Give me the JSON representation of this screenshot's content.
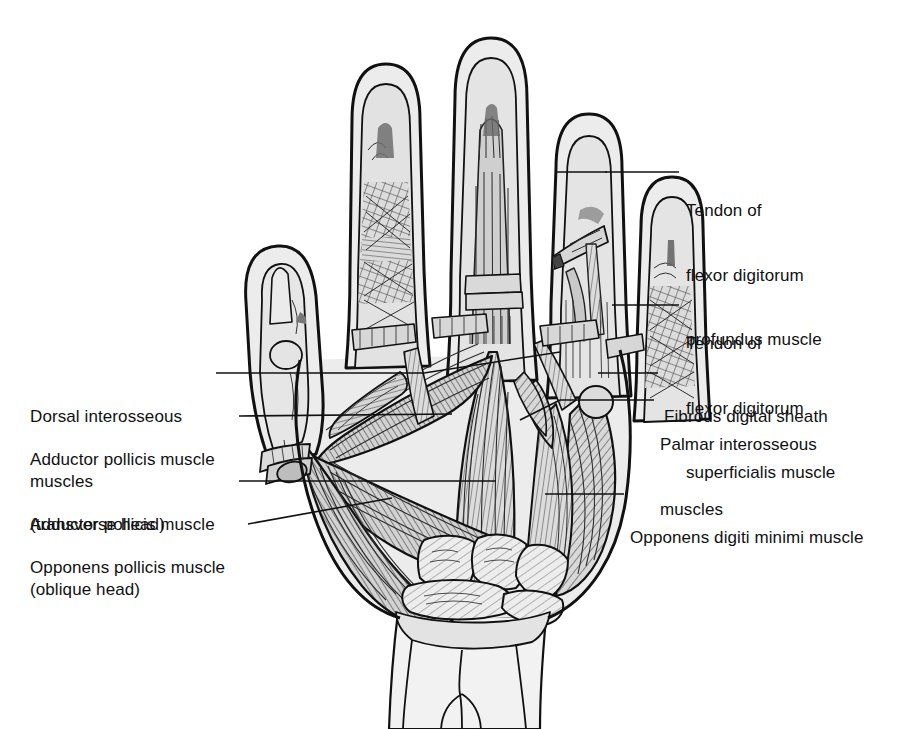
{
  "figure": {
    "background_color": "#ffffff",
    "ink_color": "#111111",
    "skin_fill": "#e9e9e9",
    "muscle_fill": "#d4d4d4",
    "shadow_fill": "#9a9a9a"
  },
  "labels": {
    "right": [
      {
        "id": "tendon-flexor-digitorum-profundus",
        "lines": [
          "Tendon of",
          "flexor digitorum",
          "profundus muscle"
        ],
        "x": 686,
        "y": 157,
        "leader": {
          "x1": 605,
          "y1": 172,
          "x2": 679,
          "y2": 172
        }
      },
      {
        "id": "tendon-flexor-digitorum-superficialis",
        "lines": [
          "Tendon of",
          "flexor digitorum",
          "superficialis muscle"
        ],
        "x": 686,
        "y": 290,
        "leader": {
          "x1": 612,
          "y1": 305,
          "x2": 679,
          "y2": 305
        }
      },
      {
        "id": "fibrous-digital-sheath",
        "lines": [
          "Fibrous digital sheath"
        ],
        "x": 664,
        "y": 363,
        "leader": {
          "x1": 598,
          "y1": 373,
          "x2": 658,
          "y2": 373
        }
      },
      {
        "id": "palmar-interosseous-muscles",
        "lines": [
          "Palmar interosseous",
          "muscles"
        ],
        "x": 660,
        "y": 391,
        "leader": {
          "x1": 560,
          "y1": 400,
          "x2": 654,
          "y2": 400
        }
      },
      {
        "id": "opponens-digiti-minimi-muscle",
        "lines": [
          "Opponens digiti minimi muscle"
        ],
        "x": 630,
        "y": 484,
        "leader": {
          "x1": 545,
          "y1": 494,
          "x2": 624,
          "y2": 494
        }
      }
    ],
    "left": [
      {
        "id": "dorsal-interosseous-muscles",
        "lines": [
          "Dorsal interosseous",
          "muscles"
        ],
        "x": 30,
        "y": 363,
        "leader": {
          "x1": 216,
          "y1": 373,
          "x2": 400,
          "y2": 373
        }
      },
      {
        "id": "adductor-pollicis-muscle-transverse-head",
        "lines": [
          "Adductor pollicis muscle",
          "(transverse head)"
        ],
        "x": 30,
        "y": 406,
        "leader": {
          "x1": 239,
          "y1": 416,
          "x2": 430,
          "y2": 414
        }
      },
      {
        "id": "adductor-pollicis-muscle-oblique-head",
        "lines": [
          "Adductor pollicis muscle",
          "(oblique head)"
        ],
        "x": 30,
        "y": 471,
        "leader": {
          "x1": 239,
          "y1": 481,
          "x2": 470,
          "y2": 481
        }
      },
      {
        "id": "opponens-pollicis-muscle",
        "lines": [
          "Opponens pollicis muscle"
        ],
        "x": 30,
        "y": 514,
        "leader": {
          "x1": 248,
          "y1": 524,
          "x2": 380,
          "y2": 500
        }
      }
    ]
  },
  "structures": [
    {
      "name": "thumb",
      "region": "radial border"
    },
    {
      "name": "index-finger",
      "region": "digit 2"
    },
    {
      "name": "middle-finger",
      "region": "digit 3"
    },
    {
      "name": "ring-finger",
      "region": "digit 4"
    },
    {
      "name": "little-finger",
      "region": "digit 5"
    },
    {
      "name": "thenar-eminence",
      "region": "radial palm"
    },
    {
      "name": "hypothenar-eminence",
      "region": "ulnar palm"
    },
    {
      "name": "carpal-bones",
      "region": "wrist"
    },
    {
      "name": "forearm-stump",
      "region": "distal forearm"
    }
  ]
}
